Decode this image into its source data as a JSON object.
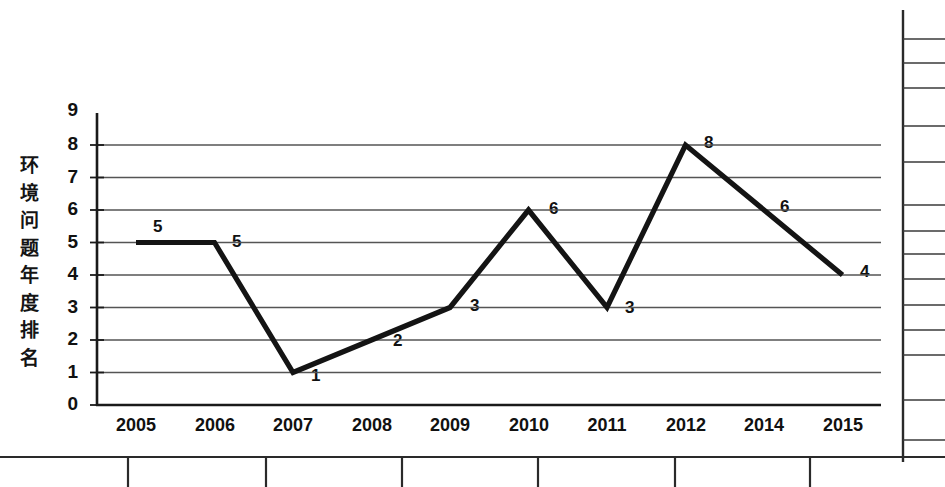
{
  "chart_data": {
    "type": "line",
    "title": "",
    "subtitle": "",
    "xlabel": "",
    "ylabel": "环境问题年度排名",
    "ylabel_chars": [
      "环",
      "境",
      "问",
      "题",
      "年",
      "度",
      "排",
      "名"
    ],
    "categories": [
      "2005",
      "2006",
      "2007",
      "2008",
      "2009",
      "2010",
      "2011",
      "2012",
      "2014",
      "2015"
    ],
    "values": [
      5,
      5,
      1,
      2,
      3,
      6,
      3,
      8,
      6,
      4
    ],
    "point_labels": [
      "5",
      "5",
      "1",
      "2",
      "3",
      "6",
      "3",
      "8",
      "6",
      "4"
    ],
    "ylim": [
      0,
      9
    ],
    "ytick_labels": [
      "0",
      "1",
      "2",
      "3",
      "4",
      "5",
      "6",
      "7",
      "8",
      "9"
    ],
    "gridlines_at": [
      0,
      1,
      2,
      3,
      4,
      5,
      6,
      7,
      8
    ],
    "grid": true,
    "legend": "none",
    "line_color": "#1a1a1a",
    "grid_color": "#555555",
    "axis_color": "#1a1a1a",
    "background_color": "#ffffff"
  },
  "artifacts": {
    "right_rule_label": "page-edge-rule",
    "bottom_rule_label": "page-edge-rule",
    "bottom_divider_positions": [
      128,
      266,
      402,
      538,
      675,
      810
    ],
    "right_stub_positions": [
      39,
      63,
      88,
      126,
      162,
      205,
      231,
      254,
      279,
      305,
      330,
      355,
      400,
      440
    ]
  }
}
